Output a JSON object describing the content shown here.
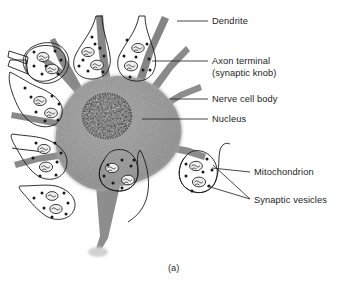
{
  "figure": {
    "caption": "(a)",
    "background_color": "#ffffff",
    "ink_color": "#1d1d1d"
  },
  "colors": {
    "cell_body_fill": "#8f8f8f",
    "cell_body_fill_light": "#9c9c9c",
    "dendrite_fill": "#8a8a8a",
    "nucleus_fill": "#2a2a2a",
    "knob_fill": "#f2f2f2",
    "outline": "#1a1a1a",
    "leader_line": "#262626",
    "label_text": "#1d1d1d",
    "shadow": "#c9c9c9"
  },
  "labels": [
    {
      "id": "dendrite",
      "text": "Dendrite",
      "x": 212,
      "y": 24,
      "leader": {
        "x1": 177,
        "y1": 21,
        "x2": 208,
        "y2": 21
      }
    },
    {
      "id": "axon-terminal",
      "line1": "Axon terminal",
      "line2": "(synaptic knob)",
      "x": 212,
      "y": 64,
      "y2": 76,
      "leader": {
        "x1": 152,
        "y1": 61,
        "x2": 208,
        "y2": 61
      }
    },
    {
      "id": "nerve-cell-body",
      "text": "Nerve cell body",
      "x": 212,
      "y": 102,
      "leader": {
        "x1": 170,
        "y1": 99,
        "x2": 208,
        "y2": 99
      }
    },
    {
      "id": "nucleus",
      "text": "Nucleus",
      "x": 212,
      "y": 122,
      "leader": {
        "x1": 142,
        "y1": 119,
        "x2": 208,
        "y2": 119
      }
    },
    {
      "id": "mitochondrion",
      "text": "Mitochondrion",
      "x": 254,
      "y": 175,
      "leader": {
        "x1": 212,
        "y1": 168,
        "x2": 250,
        "y2": 172
      }
    },
    {
      "id": "synaptic-vesicles",
      "text": "Synaptic vesicles",
      "x": 254,
      "y": 203,
      "leader": {
        "x1": 213,
        "y1": 166,
        "x2": 250,
        "y2": 199
      },
      "leader2": {
        "x1": 209,
        "y1": 183,
        "x2": 250,
        "y2": 199
      }
    }
  ],
  "structures": {
    "cell_body": {
      "name": "Nerve cell body",
      "center_x": 108,
      "center_y": 128
    },
    "nucleus": {
      "name": "Nucleus",
      "center_x": 107,
      "center_y": 115,
      "radius_x": 24,
      "radius_y": 22
    },
    "dendrite_count": 8,
    "synaptic_knobs": [
      {
        "id": "knob-top-left",
        "cx": 57,
        "cy": 56,
        "vesicles": 7,
        "mitochondria": 2
      },
      {
        "id": "knob-top-mid",
        "cx": 92,
        "cy": 47,
        "vesicles": 8,
        "mitochondria": 2
      },
      {
        "id": "knob-top-right",
        "cx": 135,
        "cy": 50,
        "vesicles": 8,
        "mitochondria": 2
      },
      {
        "id": "knob-left-upper",
        "cx": 40,
        "cy": 95,
        "vesicles": 7,
        "mitochondria": 2
      },
      {
        "id": "knob-left-mid",
        "cx": 40,
        "cy": 140,
        "vesicles": 7,
        "mitochondria": 2
      },
      {
        "id": "knob-left-lower",
        "cx": 52,
        "cy": 185,
        "vesicles": 7,
        "mitochondria": 2
      },
      {
        "id": "knob-center-low",
        "cx": 118,
        "cy": 178,
        "vesicles": 7,
        "mitochondria": 2
      },
      {
        "id": "knob-right",
        "cx": 200,
        "cy": 172,
        "vesicles": 7,
        "mitochondria": 2
      }
    ]
  }
}
